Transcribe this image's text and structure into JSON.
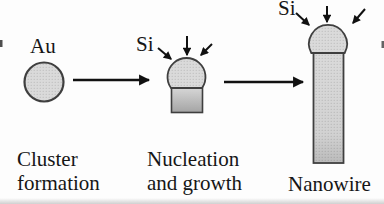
{
  "figure": {
    "background": "#fdfdfd",
    "colors": {
      "ink": "#161616",
      "outline": "#3f3f3f",
      "shape_fill": "#d9d9d9",
      "arrow": "#111111"
    },
    "stages": [
      {
        "material_label": "Au",
        "caption_line1": "Cluster",
        "caption_line2": "formation"
      },
      {
        "material_label": "Si",
        "caption_line1": "Nucleation",
        "caption_line2": "and growth"
      },
      {
        "material_label": "Si",
        "caption_line1": "Nanowire"
      }
    ]
  }
}
